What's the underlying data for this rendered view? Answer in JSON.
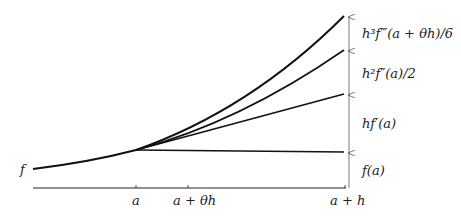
{
  "diagram": {
    "curve_label": "f",
    "axis_ticks": [
      {
        "label": "a",
        "x": 136
      },
      {
        "label": "a + θh",
        "x": 188
      },
      {
        "label": "a + h",
        "x": 345
      }
    ],
    "increments": [
      {
        "label": "f(a)",
        "from_y": 188,
        "to_y": 152
      },
      {
        "label": "hf′(a)",
        "from_y": 152,
        "to_y": 94
      },
      {
        "label": "h²f″(a)/2",
        "from_y": 94,
        "to_y": 50
      },
      {
        "label": "h³f‴(a + θh)/6",
        "from_y": 50,
        "to_y": 16
      }
    ],
    "labels": {
      "f": "f",
      "a": "a",
      "a_theta_h": "a + θh",
      "a_h": "a + h",
      "fa": "f(a)",
      "hfa_prime": "hf′(a)",
      "h2_term": "h²f″(a)/2",
      "h3_term": "h³f‴(a + θh)/6"
    }
  }
}
